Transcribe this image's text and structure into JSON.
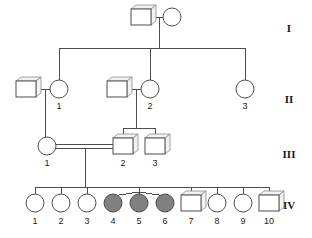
{
  "figure": {
    "type": "pedigree-chart",
    "title": "",
    "colors": {
      "line": "#4d4d4d",
      "affected_fill": "#808080",
      "unaffected_fill": "#ffffff",
      "background": "#ffffff",
      "text": "#1a1a1a"
    }
  },
  "generation_labels": [
    {
      "id": "gen-I",
      "label": "I",
      "y": 32
    },
    {
      "id": "gen-II",
      "label": "II",
      "y": 103
    },
    {
      "id": "gen-III",
      "label": "III",
      "y": 158
    },
    {
      "id": "gen-IV",
      "label": "IV",
      "y": 209
    }
  ],
  "individuals": [
    {
      "id": "I-1",
      "generation": "I",
      "number": "",
      "sex": "male",
      "shape": "square",
      "affected": false,
      "cx": 143,
      "cy": 17
    },
    {
      "id": "I-2",
      "generation": "I",
      "number": "",
      "sex": "female",
      "shape": "circle",
      "affected": false,
      "cx": 175,
      "cy": 17
    },
    {
      "id": "II-A",
      "generation": "II",
      "number": "",
      "sex": "male",
      "shape": "square",
      "affected": false,
      "cx": 28,
      "cy": 89
    },
    {
      "id": "II-1",
      "generation": "II",
      "number": "1",
      "sex": "female",
      "shape": "circle",
      "affected": false,
      "cx": 59,
      "cy": 89
    },
    {
      "id": "II-B",
      "generation": "II",
      "number": "",
      "sex": "male",
      "shape": "square",
      "affected": false,
      "cx": 118,
      "cy": 89
    },
    {
      "id": "II-2",
      "generation": "II",
      "number": "2",
      "sex": "female",
      "shape": "circle",
      "affected": false,
      "cx": 150,
      "cy": 89
    },
    {
      "id": "II-3",
      "generation": "II",
      "number": "3",
      "sex": "female",
      "shape": "circle",
      "affected": false,
      "cx": 245,
      "cy": 89
    },
    {
      "id": "III-1",
      "generation": "III",
      "number": "1",
      "sex": "female",
      "shape": "circle",
      "affected": false,
      "cx": 47,
      "cy": 146
    },
    {
      "id": "III-2",
      "generation": "III",
      "number": "2",
      "sex": "male",
      "shape": "square",
      "affected": false,
      "cx": 123,
      "cy": 146
    },
    {
      "id": "III-3",
      "generation": "III",
      "number": "3",
      "sex": "male",
      "shape": "square",
      "affected": false,
      "cx": 155,
      "cy": 146
    },
    {
      "id": "IV-1",
      "generation": "IV",
      "number": "1",
      "sex": "female",
      "shape": "circle",
      "affected": false,
      "cx": 35,
      "cy": 203
    },
    {
      "id": "IV-2",
      "generation": "IV",
      "number": "2",
      "sex": "female",
      "shape": "circle",
      "affected": false,
      "cx": 61,
      "cy": 203
    },
    {
      "id": "IV-3",
      "generation": "IV",
      "number": "3",
      "sex": "female",
      "shape": "circle",
      "affected": false,
      "cx": 87,
      "cy": 203
    },
    {
      "id": "IV-4",
      "generation": "IV",
      "number": "4",
      "sex": "female",
      "shape": "circle",
      "affected": true,
      "cx": 113,
      "cy": 203
    },
    {
      "id": "IV-5",
      "generation": "IV",
      "number": "5",
      "sex": "female",
      "shape": "circle",
      "affected": true,
      "cx": 139,
      "cy": 203
    },
    {
      "id": "IV-6",
      "generation": "IV",
      "number": "6",
      "sex": "female",
      "shape": "circle",
      "affected": true,
      "cx": 165,
      "cy": 203
    },
    {
      "id": "IV-7",
      "generation": "IV",
      "number": "7",
      "sex": "male",
      "shape": "square",
      "affected": false,
      "cx": 191,
      "cy": 203
    },
    {
      "id": "IV-8",
      "generation": "IV",
      "number": "8",
      "sex": "female",
      "shape": "circle",
      "affected": false,
      "cx": 217,
      "cy": 203
    },
    {
      "id": "IV-9",
      "generation": "IV",
      "number": "9",
      "sex": "female",
      "shape": "circle",
      "affected": false,
      "cx": 243,
      "cy": 203
    },
    {
      "id": "IV-10",
      "generation": "IV",
      "number": "10",
      "sex": "male",
      "shape": "square",
      "affected": false,
      "cx": 269,
      "cy": 203
    }
  ],
  "relationships": [
    {
      "id": "mating-I",
      "type": "mating",
      "partners": [
        "I-1",
        "I-2"
      ],
      "consanguineous": false
    },
    {
      "id": "mating-II-1",
      "type": "mating",
      "partners": [
        "II-A",
        "II-1"
      ],
      "consanguineous": false
    },
    {
      "id": "mating-II-2",
      "type": "mating",
      "partners": [
        "II-B",
        "II-2"
      ],
      "consanguineous": false
    },
    {
      "id": "mating-III",
      "type": "mating",
      "partners": [
        "III-1",
        "III-2"
      ],
      "consanguineous": true
    },
    {
      "id": "sibship-II",
      "type": "sibship",
      "children": [
        "II-1",
        "II-2",
        "II-3"
      ]
    },
    {
      "id": "sibship-III-left",
      "type": "sibship",
      "children": [
        "III-1"
      ]
    },
    {
      "id": "sibship-III-right",
      "type": "sibship",
      "children": [
        "III-2",
        "III-3"
      ]
    },
    {
      "id": "sibship-IV",
      "type": "sibship",
      "children": [
        "IV-1",
        "IV-2",
        "IV-3",
        "IV-4",
        "IV-5",
        "IV-6",
        "IV-7",
        "IV-8",
        "IV-9",
        "IV-10"
      ]
    },
    {
      "id": "multiple-birth-IV",
      "type": "multiple-birth",
      "members": [
        "IV-4",
        "IV-5",
        "IV-6"
      ]
    }
  ],
  "legend": {
    "affected_meaning": "shaded = affected",
    "unaffected_meaning": "open = unaffected"
  }
}
